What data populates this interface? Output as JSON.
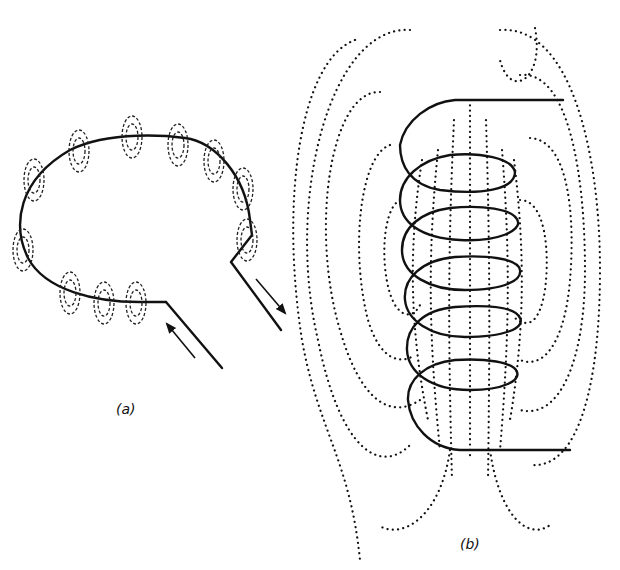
{
  "figure": {
    "panel_a": {
      "label": "(a)",
      "description": "Single current loop with circular magnetic field lines around the wire",
      "current_arrows": [
        "in",
        "out"
      ],
      "field_ring_count": 12
    },
    "panel_b": {
      "label": "(b)",
      "description": "Solenoid coil with dotted magnetic field lines",
      "turns": 6
    }
  },
  "colors": {
    "line": "#111111",
    "background": "#ffffff"
  }
}
